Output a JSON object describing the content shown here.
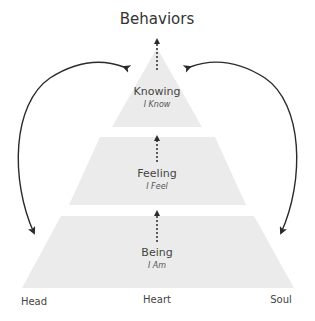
{
  "title": "Behaviors",
  "tiers": [
    {
      "label": "Knowing",
      "sub": "I Know"
    },
    {
      "label": "Feeling",
      "sub": "I Feel"
    },
    {
      "label": "Being",
      "sub": "I Am"
    }
  ],
  "axis": {
    "left": "Head",
    "center": "Heart",
    "right": "Soul"
  },
  "colors": {
    "tier_fill": "#ebebeb",
    "arrow": "#2a2a2a"
  }
}
